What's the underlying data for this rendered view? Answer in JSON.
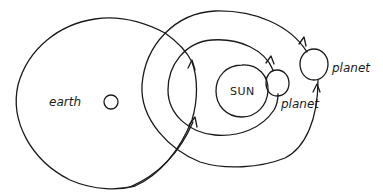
{
  "diagram": {
    "type": "heliocentric orbit sketch",
    "bodies": {
      "earth": {
        "label": "earth"
      },
      "sun": {
        "label": "SUN"
      },
      "inner_planet": {
        "label": "planet"
      },
      "outer_planet": {
        "label": "planet"
      }
    },
    "colors": {
      "ink": "#1a1a1a",
      "background": "#ffffff"
    }
  }
}
